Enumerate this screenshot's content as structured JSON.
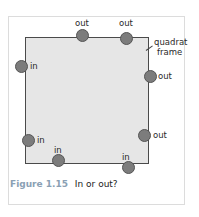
{
  "figure": {
    "caption_label": "Figure 1.15",
    "caption_text": "In or out?",
    "frame_label_line1": "quadrat",
    "frame_label_line2": "frame",
    "colors": {
      "quadrat_fill": "#e6e6e6",
      "quadrat_border": "#4a4a4a",
      "dot_fill": "#7c7c7c",
      "caption_label": "#8aa0b4"
    },
    "points": [
      {
        "id": "top-left",
        "label": "out",
        "x": 82,
        "y": 35,
        "label_x": 75,
        "label_y": 19
      },
      {
        "id": "top-right",
        "label": "out",
        "x": 126,
        "y": 38,
        "label_x": 119,
        "label_y": 19
      },
      {
        "id": "left-upper",
        "label": "in",
        "x": 21,
        "y": 66,
        "label_x": 30,
        "label_y": 62
      },
      {
        "id": "right-upper",
        "label": "out",
        "x": 150,
        "y": 76,
        "label_x": 158,
        "label_y": 72
      },
      {
        "id": "right-lower",
        "label": "out",
        "x": 144,
        "y": 135,
        "label_x": 153,
        "label_y": 131
      },
      {
        "id": "left-lower",
        "label": "in",
        "x": 28,
        "y": 140,
        "label_x": 37,
        "label_y": 136
      },
      {
        "id": "bottom-left",
        "label": "in",
        "x": 58,
        "y": 160,
        "label_x": 54,
        "label_y": 146
      },
      {
        "id": "bottom-right",
        "label": "in",
        "x": 128,
        "y": 167,
        "label_x": 122,
        "label_y": 153
      }
    ]
  }
}
